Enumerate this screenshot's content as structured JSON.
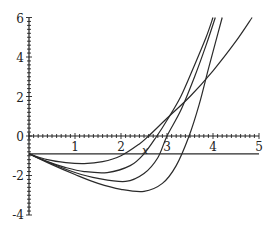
{
  "chart_data": {
    "type": "line",
    "title": "",
    "xlabel": "x",
    "ylabel": "",
    "xlim": [
      0,
      5
    ],
    "ylim": [
      -4,
      6
    ],
    "grid": false,
    "legend": null,
    "x_ticks": [
      "0",
      "1",
      "2",
      "3",
      "4",
      "5"
    ],
    "y_ticks": [
      "6",
      "4",
      "2",
      "-2",
      "-4"
    ],
    "series": [
      {
        "name": "horizontal line",
        "x": [
          0,
          5
        ],
        "y": [
          -0.9,
          -0.9
        ]
      },
      {
        "name": "curve 1",
        "x": [
          0,
          0.4,
          0.8,
          1.2,
          1.6,
          2.0,
          2.4,
          2.6,
          3.0,
          3.5,
          4.0,
          4.5,
          4.85
        ],
        "y": [
          -0.9,
          -1.2,
          -1.35,
          -1.4,
          -1.3,
          -1.0,
          -0.4,
          0.0,
          0.9,
          2.0,
          3.3,
          4.8,
          6.0
        ]
      },
      {
        "name": "curve 2",
        "x": [
          0,
          0.4,
          0.8,
          1.2,
          1.7,
          2.2,
          2.5,
          2.78,
          3.0,
          3.3,
          3.6,
          3.85,
          4.0
        ],
        "y": [
          -0.9,
          -1.3,
          -1.6,
          -1.8,
          -1.85,
          -1.5,
          -0.9,
          0.0,
          0.8,
          2.0,
          3.6,
          5.0,
          6.0
        ]
      },
      {
        "name": "curve 3",
        "x": [
          0,
          0.5,
          1.0,
          1.5,
          2.1,
          2.5,
          2.8,
          3.0,
          3.3,
          3.6,
          3.85,
          4.05
        ],
        "y": [
          -0.9,
          -1.4,
          -1.85,
          -2.15,
          -2.3,
          -1.9,
          -1.1,
          0.0,
          1.3,
          3.0,
          4.6,
          6.0
        ]
      },
      {
        "name": "curve 4",
        "x": [
          0,
          0.5,
          1.0,
          1.5,
          2.0,
          2.5,
          2.9,
          3.2,
          3.48,
          3.7,
          3.9,
          4.05,
          4.2
        ],
        "y": [
          -0.9,
          -1.45,
          -1.95,
          -2.4,
          -2.7,
          -2.8,
          -2.4,
          -1.5,
          0.0,
          1.6,
          3.4,
          4.7,
          6.0
        ]
      }
    ],
    "annotations": [
      {
        "text": "x",
        "x": 2.5,
        "y": -0.75
      }
    ]
  },
  "axes": {
    "x_label": "x",
    "x_tick_labels": [
      "0",
      "1",
      "2",
      "3",
      "4",
      "5"
    ],
    "y_tick_labels": [
      "6",
      "4",
      "2",
      "-2",
      "-4"
    ]
  }
}
